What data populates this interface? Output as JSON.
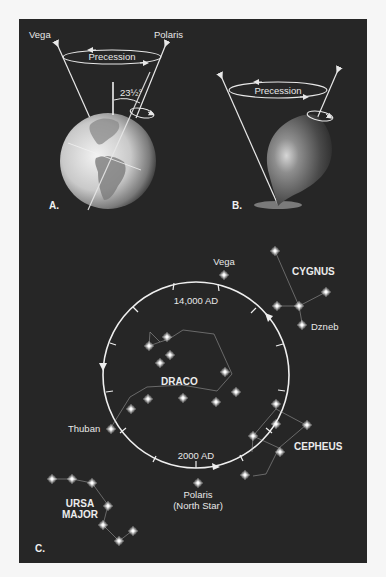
{
  "figure": {
    "background_color": "#262626",
    "page_color": "#f6f6f6",
    "line_color": "#e8e8e8"
  },
  "panel_a": {
    "letter": "A.",
    "labels": {
      "vega": "Vega",
      "polaris": "Polaris",
      "precession": "Precession",
      "tilt": "23½°"
    }
  },
  "panel_b": {
    "letter": "B.",
    "labels": {
      "precession": "Precession"
    }
  },
  "panel_c": {
    "letter": "C.",
    "circle_labels": {
      "top": "14,000 AD",
      "bottom": "2000 AD"
    },
    "stars": {
      "vega": "Vega",
      "dzneb": "Dzneb",
      "thuban": "Thuban",
      "polaris_line1": "Polaris",
      "polaris_line2": "(North Star)"
    },
    "constellations": {
      "cygnus": "CYGNUS",
      "draco": "DRACO",
      "cepheus": "CEPHEUS",
      "ursa_major_line1": "URSA",
      "ursa_major_line2": "MAJOR"
    }
  }
}
